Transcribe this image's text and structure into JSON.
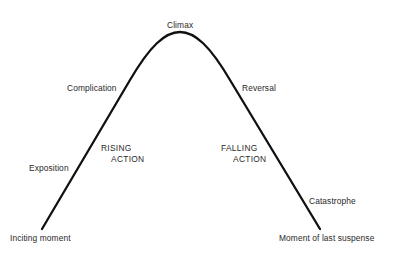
{
  "diagram": {
    "line_color": "#111111",
    "background": "#ffffff",
    "points": {
      "inciting_moment": "Inciting moment",
      "exposition": "Exposition",
      "complication": "Complication",
      "climax": "Climax",
      "reversal": "Reversal",
      "catastrophe": "Catastrophe",
      "moment_of_last_suspense": "Moment of last suspense"
    },
    "regions": {
      "rising_action": [
        "RISING",
        "ACTION"
      ],
      "falling_action": [
        "FALLING",
        "ACTION"
      ]
    }
  }
}
